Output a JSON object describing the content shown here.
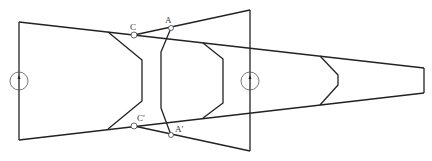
{
  "diagram": {
    "stroke_color": "#222222",
    "labels": {
      "C": "C",
      "A": "A",
      "C_prime": "C′",
      "A_prime": "A′"
    },
    "points": {
      "C": [
        134,
        35
      ],
      "A": [
        171,
        28
      ],
      "C_prime": [
        134,
        126
      ],
      "A_prime": [
        171,
        135
      ]
    },
    "components": [
      {
        "name": "left-trapezoid-channel",
        "description": "tapered channel from left edge to right end"
      },
      {
        "name": "middle-trapezoid",
        "description": "flared trapezoid with vertical right edge"
      },
      {
        "name": "left-hexagon-lens"
      },
      {
        "name": "curved-lens-through-A"
      },
      {
        "name": "middle-hexagon-lens"
      },
      {
        "name": "right-hexagon-lens"
      },
      {
        "name": "left-aperture-circle"
      },
      {
        "name": "middle-aperture-circle"
      }
    ]
  }
}
